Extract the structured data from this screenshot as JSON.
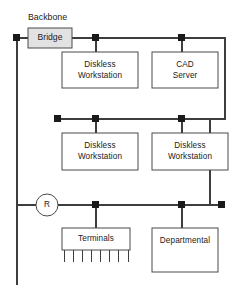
{
  "diagram": {
    "backbone_label": "Backbone",
    "bridge": {
      "label": "Bridge",
      "fill": "#e2e2e2"
    },
    "router": {
      "label": "R"
    },
    "nodes": [
      {
        "id": "top-left",
        "x": 17,
        "y": 38
      },
      {
        "id": "top-mid",
        "x": 96,
        "y": 38
      },
      {
        "id": "top-right",
        "x": 182,
        "y": 38
      },
      {
        "id": "mid-left",
        "x": 58,
        "y": 119
      },
      {
        "id": "mid-center",
        "x": 96,
        "y": 119
      },
      {
        "id": "mid-right",
        "x": 182,
        "y": 119
      },
      {
        "id": "bot-left",
        "x": 96,
        "y": 205
      },
      {
        "id": "bot-mid",
        "x": 182,
        "y": 205
      },
      {
        "id": "bot-end",
        "x": 222,
        "y": 205
      }
    ],
    "boxes": [
      {
        "id": "diskless-1",
        "label_line1": "Diskless",
        "label_line2": "Workstation",
        "x": 62,
        "y": 52,
        "w": 76,
        "h": 36
      },
      {
        "id": "cad-server",
        "label_line1": "CAD",
        "label_line2": "Server",
        "x": 152,
        "y": 52,
        "w": 66,
        "h": 36
      },
      {
        "id": "diskless-2",
        "label_line1": "Diskless",
        "label_line2": "Workstation",
        "x": 62,
        "y": 133,
        "w": 76,
        "h": 37
      },
      {
        "id": "diskless-3",
        "label_line1": "Diskless",
        "label_line2": "Workstation",
        "x": 152,
        "y": 133,
        "w": 76,
        "h": 37
      },
      {
        "id": "terminals",
        "label_line1": "Terminals",
        "label_line2": "",
        "x": 62,
        "y": 228,
        "w": 68,
        "h": 22
      },
      {
        "id": "departmental",
        "label_line1": "Departmental",
        "label_line2": "",
        "x": 152,
        "y": 228,
        "w": 66,
        "h": 44
      }
    ],
    "terminal_comb": {
      "teeth_count": 8,
      "x_start": 62,
      "x_end": 130,
      "y_top": 250,
      "y_bottom": 262
    },
    "colors": {
      "wire": "#3d3d3d",
      "node": "#1a1a1a",
      "box_stroke": "#4a4a4a",
      "box_fill": "#ffffff",
      "background": "#ffffff"
    }
  }
}
